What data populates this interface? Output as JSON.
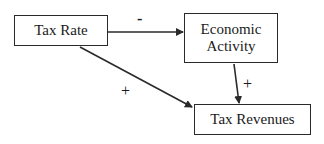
{
  "diagram": {
    "type": "causal-loop",
    "nodes": [
      {
        "id": "tax_rate",
        "label": "Tax Rate"
      },
      {
        "id": "economic_activity",
        "label": "Economic\nActivity",
        "lines": [
          "Economic",
          "Activity"
        ]
      },
      {
        "id": "tax_revenues",
        "label": "Tax Revenues"
      }
    ],
    "edges": [
      {
        "from": "tax_rate",
        "to": "economic_activity",
        "sign": "-"
      },
      {
        "from": "tax_rate",
        "to": "tax_revenues",
        "sign": "+"
      },
      {
        "from": "economic_activity",
        "to": "tax_revenues",
        "sign": "+"
      }
    ]
  },
  "colors": {
    "line": "#2a2a2a",
    "background": "#ffffff",
    "text": "#1a1a1a"
  }
}
